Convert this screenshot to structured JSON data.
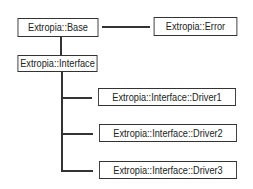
{
  "diagram": {
    "nodes": [
      {
        "id": "base",
        "label": "Extropia::Base"
      },
      {
        "id": "error",
        "label": "Extropia::Error"
      },
      {
        "id": "interface",
        "label": "Extropia::Interface"
      },
      {
        "id": "driver1",
        "label": "Extropia::Interface::Driver1"
      },
      {
        "id": "driver2",
        "label": "Extropia::Interface::Driver2"
      },
      {
        "id": "driver3",
        "label": "Extropia::Interface::Driver3"
      }
    ],
    "edges": [
      {
        "from": "base",
        "to": "error"
      },
      {
        "from": "base",
        "to": "interface"
      },
      {
        "from": "interface",
        "to": "driver1"
      },
      {
        "from": "interface",
        "to": "driver2"
      },
      {
        "from": "interface",
        "to": "driver3"
      }
    ]
  }
}
